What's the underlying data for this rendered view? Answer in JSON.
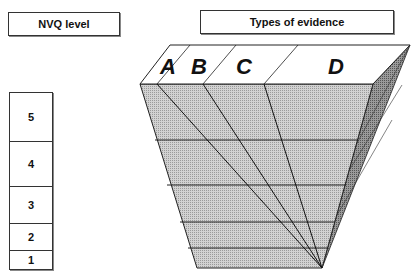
{
  "headers": {
    "nvq_level": "NVQ level",
    "types_of_evidence": "Types of evidence"
  },
  "levels": [
    {
      "label": "5",
      "top": 0,
      "height": 49
    },
    {
      "label": "4",
      "top": 49,
      "height": 45
    },
    {
      "label": "3",
      "top": 94,
      "height": 37
    },
    {
      "label": "2",
      "top": 131,
      "height": 27
    },
    {
      "label": "1",
      "top": 158,
      "height": 18
    }
  ],
  "evidence_types": [
    "A",
    "B",
    "C",
    "D"
  ],
  "colors": {
    "front_face": "#c8c8c8",
    "side_face": "#8a8a8a",
    "top_face": "#ffffff",
    "lines": "#222222"
  }
}
